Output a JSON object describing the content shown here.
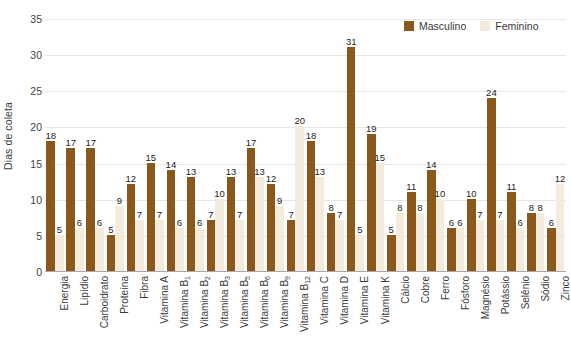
{
  "chart_data": {
    "type": "bar",
    "title": "",
    "xlabel": "",
    "ylabel": "Dias de coleta",
    "ylim": [
      0,
      35
    ],
    "ytick_step": 5,
    "yticks": [
      35,
      30,
      25,
      20,
      15,
      10,
      5,
      0
    ],
    "grid": true,
    "legend_position": "top-right",
    "categories": [
      "Energia",
      "Lipídio",
      "Carboidrato",
      "Proteína",
      "Fibra",
      "Vitamina A",
      "Vitamina B1",
      "Vitamina B2",
      "Vitamina B3",
      "Vitamina B5",
      "Vitamina B6",
      "Vitamina B9",
      "Vitamina B12",
      "Vitamina C",
      "Vitamina D",
      "Vitamina E",
      "Vitamina K",
      "Cálcio",
      "Cobre",
      "Ferro",
      "Fósforo",
      "Magnésio",
      "Potássio",
      "Selênio",
      "Sódio",
      "Zinco"
    ],
    "category_labels": [
      {
        "base": "Energia",
        "sub": ""
      },
      {
        "base": "Lipídio",
        "sub": ""
      },
      {
        "base": "Carboidrato",
        "sub": ""
      },
      {
        "base": "Proteína",
        "sub": ""
      },
      {
        "base": "Fibra",
        "sub": ""
      },
      {
        "base": "Vitamina A",
        "sub": ""
      },
      {
        "base": "Vitamina B",
        "sub": "1"
      },
      {
        "base": "Vitamina B",
        "sub": "2"
      },
      {
        "base": "Vitamina B",
        "sub": "3"
      },
      {
        "base": "Vitamina B",
        "sub": "5"
      },
      {
        "base": "Vitamina B",
        "sub": "6"
      },
      {
        "base": "Vitamina B",
        "sub": "9"
      },
      {
        "base": "Vitamina B",
        "sub": "12"
      },
      {
        "base": "Vitamina C",
        "sub": ""
      },
      {
        "base": "Vitamina D",
        "sub": ""
      },
      {
        "base": "Vitamina E",
        "sub": ""
      },
      {
        "base": "Vitamina K",
        "sub": ""
      },
      {
        "base": "Cálcio",
        "sub": ""
      },
      {
        "base": "Cobre",
        "sub": ""
      },
      {
        "base": "Ferro",
        "sub": ""
      },
      {
        "base": "Fósforo",
        "sub": ""
      },
      {
        "base": "Magnésio",
        "sub": ""
      },
      {
        "base": "Potássio",
        "sub": ""
      },
      {
        "base": "Selênio",
        "sub": ""
      },
      {
        "base": "Sódio",
        "sub": ""
      },
      {
        "base": "Zinco",
        "sub": ""
      }
    ],
    "series": [
      {
        "name": "Masculino",
        "color": "#8b581b",
        "values": [
          18,
          17,
          17,
          5,
          12,
          15,
          14,
          13,
          7,
          13,
          17,
          12,
          7,
          18,
          8,
          31,
          19,
          5,
          11,
          14,
          6,
          10,
          24,
          11,
          8,
          6
        ]
      },
      {
        "name": "Feminino",
        "color": "#f3ecdd",
        "values": [
          5,
          6,
          6,
          9,
          7,
          7,
          6,
          6,
          10,
          7,
          13,
          9,
          20,
          13,
          7,
          5,
          15,
          8,
          8,
          10,
          6,
          7,
          7,
          6,
          8,
          12
        ]
      }
    ]
  },
  "legend": {
    "items": [
      {
        "label": "Masculino",
        "color": "#8b581b"
      },
      {
        "label": "Feminino",
        "color": "#f3ecdd"
      }
    ]
  },
  "axes": {
    "y_title": "Dias de coleta"
  },
  "colors": {
    "masculino": "#8b581b",
    "feminino": "#f3ecdd",
    "gridline": "#e6e6e6",
    "axis": "#a8a8a8",
    "text": "#3a3a3a",
    "background": "#ffffff"
  }
}
